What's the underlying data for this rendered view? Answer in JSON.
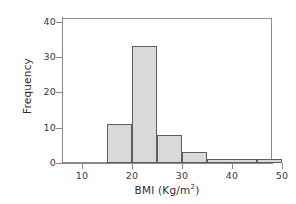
{
  "chart_data": {
    "type": "bar",
    "title": "",
    "xlabel": "BMI (Kg/m2)",
    "xlabel_base": "BMI (Kg/m",
    "xlabel_sup": "2",
    "xlabel_close": ")",
    "ylabel": "Frequency",
    "xlim": [
      6,
      48
    ],
    "ylim": [
      0,
      41
    ],
    "grid": false,
    "legend": null,
    "bin_edges": [
      15,
      20,
      25,
      30,
      35,
      45,
      50
    ],
    "categories": [
      "15-20",
      "20-25",
      "25-30",
      "30-35",
      "35-45",
      "45-50"
    ],
    "values": [
      11,
      33,
      8,
      3,
      1,
      1
    ],
    "bars": [
      {
        "x0": 15,
        "x1": 20,
        "height": 11
      },
      {
        "x0": 20,
        "x1": 25,
        "height": 33
      },
      {
        "x0": 25,
        "x1": 30,
        "height": 8
      },
      {
        "x0": 30,
        "x1": 35,
        "height": 3
      },
      {
        "x0": 35,
        "x1": 45,
        "height": 1
      },
      {
        "x0": 45,
        "x1": 50,
        "height": 1
      }
    ],
    "xticks": [
      10,
      20,
      30,
      40,
      50
    ],
    "xtick_labels": [
      "10",
      "20",
      "30",
      "40",
      "50"
    ],
    "yticks": [
      0,
      10,
      20,
      30,
      40
    ],
    "ytick_labels": [
      "0",
      "10",
      "20",
      "30",
      "40"
    ],
    "colors": {
      "bar_fill": "#d9d9d9",
      "bar_edge": "#5e5e5e",
      "axis": "#8a8a8a",
      "text": "#2e2e2e",
      "background": "#ffffff"
    }
  }
}
